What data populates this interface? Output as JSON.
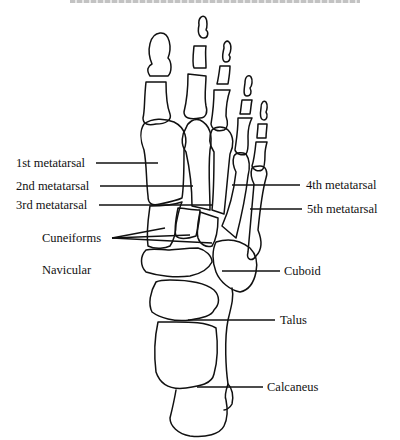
{
  "diagram": {
    "type": "anatomical-line-drawing",
    "header_truncated": true,
    "stroke_color": "#111111",
    "background_color": "#ffffff"
  },
  "labels": {
    "first_metatarsal": "1st metatarsal",
    "second_metatarsal": "2nd metatarsal",
    "third_metatarsal": "3rd metatarsal",
    "cuneiforms": "Cuneiforms",
    "navicular": "Navicular",
    "fourth_metatarsal": "4th metatarsal",
    "fifth_metatarsal": "5th metatarsal",
    "cuboid": "Cuboid",
    "talus": "Talus",
    "calcaneus": "Calcaneus"
  }
}
